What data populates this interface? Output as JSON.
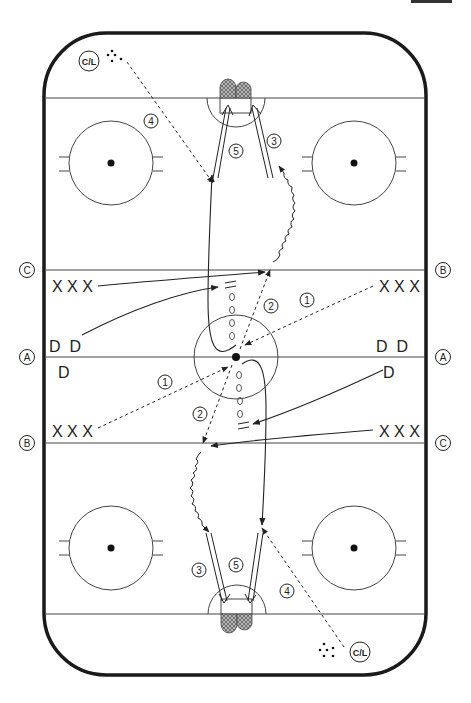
{
  "diagram": {
    "type": "hockey-drill",
    "colors": {
      "line": "#222222",
      "board": "#1a1a1a",
      "net_fill": "#9a9a9a",
      "background": "#ffffff"
    },
    "side_labels": {
      "left": [
        {
          "id": "C",
          "y": 270
        },
        {
          "id": "A",
          "y": 356
        },
        {
          "id": "B",
          "y": 443
        }
      ],
      "right": [
        {
          "id": "B",
          "y": 270
        },
        {
          "id": "A",
          "y": 356
        },
        {
          "id": "C",
          "y": 443
        }
      ]
    },
    "players": {
      "forwards_top_left": "X X X",
      "forwards_top_right": "X X X",
      "forwards_bottom_left": "X X X",
      "forwards_bottom_right": "X X X",
      "defense_left_pair": "D  D",
      "defense_left_single": "D",
      "defense_right_pair": "D  D",
      "defense_right_single": "D"
    },
    "coach_labels": {
      "top": "C/L",
      "bottom": "C/L"
    },
    "step_numbers": {
      "top_4": "4",
      "top_5": "5",
      "top_3": "3",
      "upper_2": "2",
      "upper_1": "1",
      "lower_1": "1",
      "lower_2": "2",
      "bottom_3": "3",
      "bottom_5": "5",
      "bottom_4": "4"
    },
    "legend_meaning": {
      "dashed_arrow": "pass",
      "solid_arrow": "skate",
      "wavy_arrow": "skate with puck",
      "double_arrow": "shot",
      "pylons": "cones"
    }
  }
}
